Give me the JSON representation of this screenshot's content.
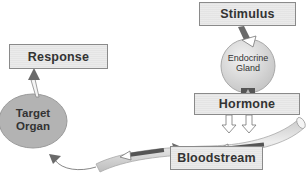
{
  "diagram": {
    "nodes": {
      "stimulus": {
        "label": "Stimulus"
      },
      "gland": {
        "label_line1": "Endocrine",
        "label_line2": "Gland"
      },
      "hormone": {
        "label": "Hormone"
      },
      "bloodstream": {
        "label": "Bloodstream"
      },
      "target": {
        "label_line1": "Target",
        "label_line2": "Organ"
      },
      "response": {
        "label": "Response"
      }
    },
    "edges": [
      {
        "from": "Stimulus",
        "to": "Endocrine Gland"
      },
      {
        "from": "Endocrine Gland",
        "to": "Hormone"
      },
      {
        "from": "Hormone",
        "to": "Bloodstream"
      },
      {
        "from": "Bloodstream",
        "to": "Target Organ"
      },
      {
        "from": "Target Organ",
        "to": "Response"
      }
    ],
    "colors": {
      "box_fill": "#e4e4e4",
      "box_border": "#8a8a8a",
      "gland_fill": "#d9d9d9",
      "organ_fill": "#b3b3b3",
      "arrow_dark": "#6a6a6a",
      "tube_fill": "#d6d6d6"
    }
  }
}
